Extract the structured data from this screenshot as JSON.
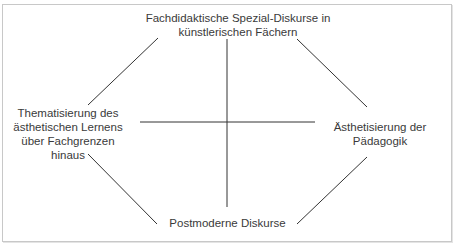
{
  "diagram": {
    "type": "four-pole cross diagram",
    "nodes": {
      "top": {
        "lines": [
          "Fachdidaktische Spezial-Diskurse in",
          "künstlerischen Fächern"
        ]
      },
      "left": {
        "lines": [
          "Thematisierung des",
          "ästhetischen Lernens",
          "über Fachgrenzen",
          "hinaus"
        ]
      },
      "right": {
        "lines": [
          "Ästhetisierung der",
          "Pädagogik"
        ]
      },
      "bottom": {
        "lines": [
          "Postmoderne Diskurse"
        ]
      }
    },
    "connections": [
      {
        "from": "top",
        "to": "bottom",
        "kind": "axis"
      },
      {
        "from": "left",
        "to": "right",
        "kind": "axis"
      },
      {
        "from": "top",
        "to": "left",
        "kind": "edge"
      },
      {
        "from": "top",
        "to": "right",
        "kind": "edge"
      },
      {
        "from": "left",
        "to": "bottom",
        "kind": "edge"
      },
      {
        "from": "right",
        "to": "bottom",
        "kind": "edge"
      }
    ],
    "colors": {
      "line": "#333333",
      "text": "#3a3a3a",
      "border": "#c8c8c8"
    }
  }
}
